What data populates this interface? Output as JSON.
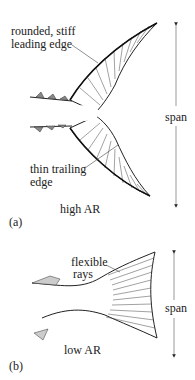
{
  "panel_a": {
    "letter": "(a)",
    "caption": "high AR",
    "annotation_leading_1": "rounded, stiff",
    "annotation_leading_2": "leading edge",
    "annotation_trailing_1": "thin trailing",
    "annotation_trailing_2": "edge",
    "span_label": "span"
  },
  "panel_b": {
    "letter": "(b)",
    "caption": "low AR",
    "annotation_rays_1": "flexible",
    "annotation_rays_2": "rays",
    "span_label": "span"
  }
}
